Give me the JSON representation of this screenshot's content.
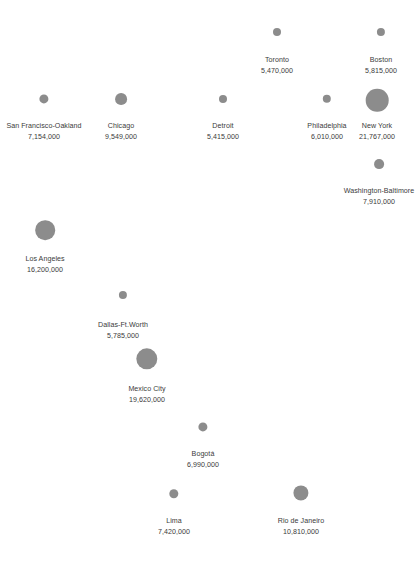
{
  "chart_data": {
    "type": "scatter",
    "title": "",
    "subtitle": "",
    "xlabel": "",
    "ylabel": "",
    "legend": "none",
    "grid": false,
    "encoding": "bubble area proportional to population",
    "value_unit": "people",
    "bubble_color": "#8c8c8c",
    "label_color": "#3b3b3b",
    "background_color": "#ffffff",
    "categories": [
      "San Francisco-Oakland",
      "Chicago",
      "Toronto",
      "Detroit",
      "Philadelphia",
      "Boston",
      "New York",
      "Washington-Baltimore",
      "Los Angeles",
      "Dallas-Ft.Worth",
      "Mexico City",
      "Bogotá",
      "Lima",
      "Rio de Janeiro"
    ],
    "values": [
      7154000,
      9549000,
      5470000,
      5415000,
      6010000,
      5815000,
      21767000,
      7910000,
      16200000,
      5785000,
      19620000,
      6990000,
      7420000,
      10810000
    ]
  },
  "map": {
    "cities": [
      {
        "name": "San Francisco-Oakland",
        "population": "7,154,000",
        "cx": 44,
        "cy": 99,
        "r": 4.6,
        "label_y": 121
      },
      {
        "name": "Chicago",
        "population": "9,549,000",
        "cx": 121,
        "cy": 99,
        "r": 5.9,
        "label_y": 121
      },
      {
        "name": "Toronto",
        "population": "5,470,000",
        "cx": 277,
        "cy": 32,
        "r": 4.0,
        "label_y": 55
      },
      {
        "name": "Detroit",
        "population": "5,415,000",
        "cx": 223,
        "cy": 99,
        "r": 4.0,
        "label_y": 121
      },
      {
        "name": "Philadelphia",
        "population": "6,010,000",
        "cx": 327,
        "cy": 99,
        "r": 4.2,
        "label_y": 121
      },
      {
        "name": "Boston",
        "population": "5,815,000",
        "cx": 381,
        "cy": 32,
        "r": 4.1,
        "label_y": 55
      },
      {
        "name": "New York",
        "population": "21,767,000",
        "cx": 377,
        "cy": 100,
        "r": 11.3,
        "label_y": 121
      },
      {
        "name": "Washington-Baltimore",
        "population": "7,910,000",
        "cx": 379,
        "cy": 164,
        "r": 4.9,
        "label_y": 186
      },
      {
        "name": "Los Angeles",
        "population": "16,200,000",
        "cx": 45,
        "cy": 230,
        "r": 9.8,
        "label_y": 254
      },
      {
        "name": "Dallas-Ft.Worth",
        "population": "5,785,000",
        "cx": 123,
        "cy": 295,
        "r": 4.1,
        "label_y": 320
      },
      {
        "name": "Mexico City",
        "population": "19,620,000",
        "cx": 147,
        "cy": 359,
        "r": 10.7,
        "label_y": 384
      },
      {
        "name": "Bogotá",
        "population": "6,990,000",
        "cx": 203,
        "cy": 427,
        "r": 4.6,
        "label_y": 449
      },
      {
        "name": "Lima",
        "population": "7,420,000",
        "cx": 174,
        "cy": 494,
        "r": 4.7,
        "label_y": 516
      },
      {
        "name": "Rio de Janeiro",
        "population": "10,810,000",
        "cx": 301,
        "cy": 493,
        "r": 7.6,
        "label_y": 516
      }
    ]
  }
}
